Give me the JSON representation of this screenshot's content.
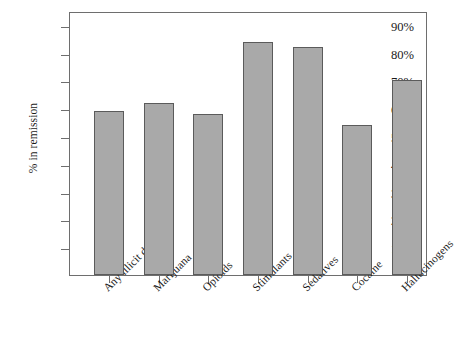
{
  "chart_data": {
    "type": "bar",
    "title": "",
    "xlabel": "",
    "ylabel": "% in remission",
    "categories": [
      "Any illicit drugs",
      "Marijuana",
      "Opioids",
      "Stimulants",
      "Sedatives",
      "Cocaine",
      "Hallucinogens"
    ],
    "values": [
      59,
      62,
      58,
      84,
      82,
      54,
      70
    ],
    "ylim": [
      0,
      95
    ],
    "yticks": [
      10,
      20,
      30,
      40,
      50,
      60,
      70,
      80,
      90
    ],
    "ytick_labels": [
      "10%",
      "20%",
      "30%",
      "40%",
      "50%",
      "60%",
      "70%",
      "80%",
      "90%"
    ],
    "grid": false,
    "legend": null,
    "bar_color": "#a9a9a9",
    "bar_edge_color": "#5b5b5b",
    "axis_color": "#6e6e6e"
  }
}
